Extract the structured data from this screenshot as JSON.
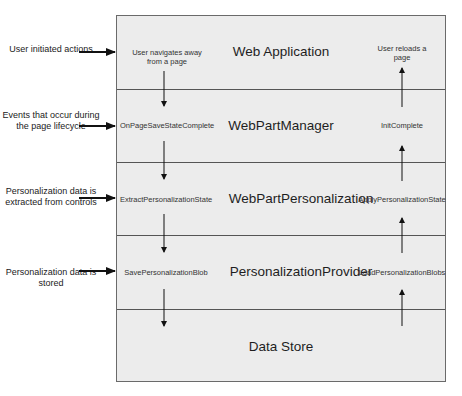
{
  "diagram": {
    "layers": [
      {
        "name": "Web Application",
        "left_event": "User navigates away from a page",
        "right_event": "User reloads a page"
      },
      {
        "name": "WebPartManager",
        "left_event": "OnPageSaveStateComplete",
        "right_event": "InitComplete"
      },
      {
        "name": "WebPartPersonalization",
        "left_event": "ExtractPersonalizationState",
        "right_event": "ApplyPersonalizationState"
      },
      {
        "name": "PersonalizationProvider",
        "left_event": "SavePersonalizationBlob",
        "right_event": "LoadPersonalizationBlobs"
      },
      {
        "name": "Data Store",
        "left_event": "",
        "right_event": ""
      }
    ],
    "side_labels": [
      "User initiated actions",
      "Events that occur during the page lifecycle",
      "Personalization data is extracted from controls",
      "Personalization data is stored"
    ],
    "flow": {
      "left_column": "downward (save)",
      "right_column": "upward (load)"
    },
    "colors": {
      "layer_fill": "#ececec",
      "lines": "#555555",
      "arrows": "#111111"
    }
  }
}
